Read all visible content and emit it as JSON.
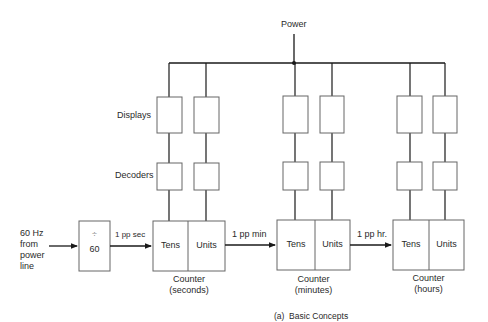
{
  "diagram": {
    "caption": "(a)  Basic Concepts",
    "power_label": "Power",
    "row_labels": {
      "displays": "Displays",
      "decoders": "Decoders"
    },
    "input": {
      "line1": "60 Hz",
      "line2": "from",
      "line3": "power",
      "line4": "line"
    },
    "divider": {
      "symbol": "÷",
      "value": "60"
    },
    "signals": {
      "sec": "1 pp sec",
      "min": "1 pp min",
      "hr": "1 pp hr."
    },
    "counters": [
      {
        "tens": "Tens",
        "units": "Units",
        "title": "Counter",
        "subtitle": "(seconds)"
      },
      {
        "tens": "Tens",
        "units": "Units",
        "title": "Counter",
        "subtitle": "(minutes)"
      },
      {
        "tens": "Tens",
        "units": "Units",
        "title": "Counter",
        "subtitle": "(hours)"
      }
    ],
    "colors": {
      "line": "#1a1a1a",
      "box_border": "#555555",
      "background": "#ffffff"
    }
  }
}
